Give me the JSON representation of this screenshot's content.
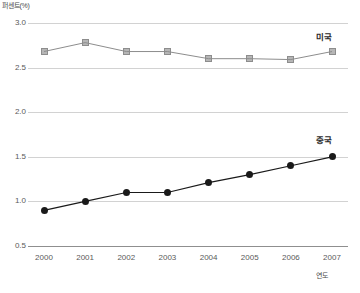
{
  "chart_data": {
    "type": "line",
    "title": "",
    "xlabel": "연도",
    "ylabel": "퍼센트(%)",
    "categories": [
      "2000",
      "2001",
      "2002",
      "2003",
      "2004",
      "2005",
      "2006",
      "2007"
    ],
    "x": [
      2000,
      2001,
      2002,
      2003,
      2004,
      2005,
      2006,
      2007
    ],
    "ylim": [
      0.5,
      3.0
    ],
    "yticks": [
      "0.5",
      "1.0",
      "1.5",
      "2.0",
      "2.5",
      "3.0"
    ],
    "ytick_values": [
      0.5,
      1.0,
      1.5,
      2.0,
      2.5,
      3.0
    ],
    "grid": true,
    "legend_position": "inline-right",
    "series": [
      {
        "name": "미국",
        "marker": "square",
        "color": "#b6b6b6",
        "line_color": "#8d8d8d",
        "values": [
          2.68,
          2.78,
          2.68,
          2.68,
          2.6,
          2.6,
          2.59,
          2.68
        ]
      },
      {
        "name": "중국",
        "marker": "circle",
        "color": "#1a1a1a",
        "line_color": "#1a1a1a",
        "values": [
          0.9,
          1.0,
          1.1,
          1.1,
          1.21,
          1.3,
          1.4,
          1.5
        ]
      }
    ]
  },
  "colors": {
    "grid": "#d2d2d2",
    "axis": "#8f8f8f",
    "us": "#b6b6b6",
    "china": "#1a1a1a",
    "background": "#ffffff"
  }
}
